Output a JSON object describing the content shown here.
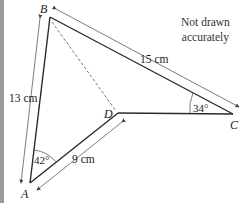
{
  "diagram": {
    "note": [
      "Not drawn",
      "accurately"
    ],
    "points": {
      "A": {
        "label": "A",
        "x": 30,
        "y": 183
      },
      "B": {
        "label": "B",
        "x": 50,
        "y": 17
      },
      "C": {
        "label": "C",
        "x": 233,
        "y": 114
      },
      "D": {
        "label": "D",
        "x": 118,
        "y": 113
      }
    },
    "lengths": {
      "AB": "13 cm",
      "BC": "15 cm",
      "AD": "9 cm"
    },
    "angles": {
      "A": "42°",
      "C": "34°"
    },
    "colors": {
      "line": "#2a2a2a",
      "dimension": "#444444",
      "strip": "#9a9a9a"
    }
  }
}
